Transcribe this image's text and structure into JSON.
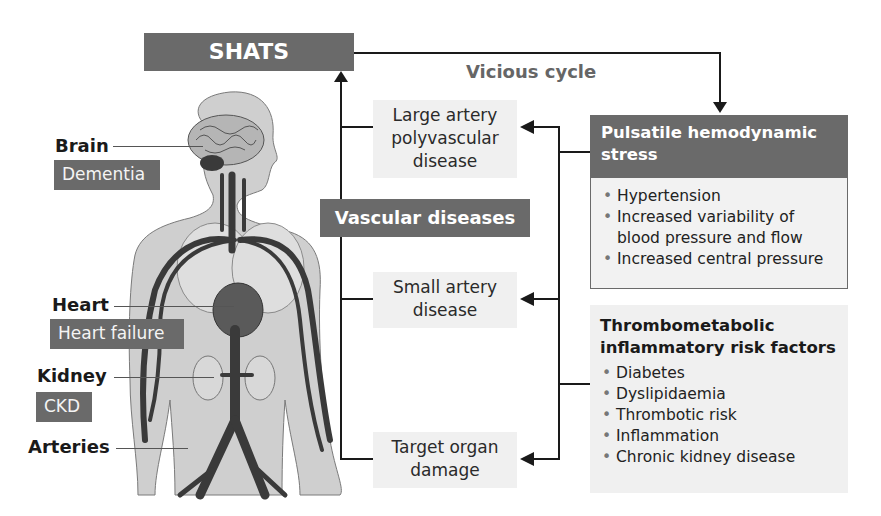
{
  "title_box": {
    "label": "SHATS"
  },
  "cycle_label": "Vicious cycle",
  "vascular_diseases": {
    "label": "Vascular diseases"
  },
  "disease_boxes": [
    {
      "label_lines": [
        "Large artery",
        "polyvascular",
        "disease"
      ]
    },
    {
      "label_lines": [
        "Small artery",
        "disease"
      ]
    },
    {
      "label_lines": [
        "Target organ",
        "damage"
      ]
    }
  ],
  "pulsatile": {
    "title_lines": [
      "Pulsatile hemodynamic",
      "stress"
    ],
    "items": [
      "Hypertension",
      "Increased variability of blood pressure and flow",
      "Increased central pressure"
    ]
  },
  "thrombometabolic": {
    "title_lines": [
      "Thrombometabolic",
      "inflammatory risk factors"
    ],
    "items": [
      "Diabetes",
      "Dyslipidaemia",
      "Thrombotic risk",
      "Inflammation",
      "Chronic kidney disease"
    ]
  },
  "organs": [
    {
      "name": "Brain",
      "disease": "Dementia"
    },
    {
      "name": "Heart",
      "disease": "Heart failure"
    },
    {
      "name": "Kidney",
      "disease": "CKD"
    },
    {
      "name": "Arteries",
      "disease": ""
    }
  ],
  "colors": {
    "dark_box": "#6a6a6a",
    "light_box": "#f0f0f0",
    "line": "#1a1a1a",
    "body_fill": "#c8c8c8",
    "vessel": "#3a3a3a"
  }
}
